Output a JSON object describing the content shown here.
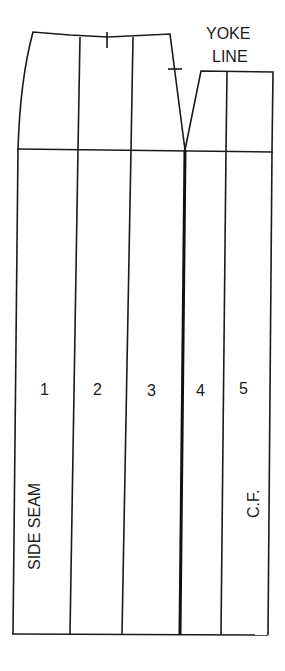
{
  "diagram": {
    "type": "pattern-slash-diagram",
    "labels": {
      "yoke_line_1": "YOKE",
      "yoke_line_2": "LINE",
      "side_seam": "SIDE SEAM",
      "center_front": "C.F."
    },
    "sections": [
      {
        "number": "1"
      },
      {
        "number": "2"
      },
      {
        "number": "3"
      },
      {
        "number": "4"
      },
      {
        "number": "5"
      }
    ],
    "colors": {
      "line": "#1a1a1a",
      "background": "#ffffff"
    }
  }
}
